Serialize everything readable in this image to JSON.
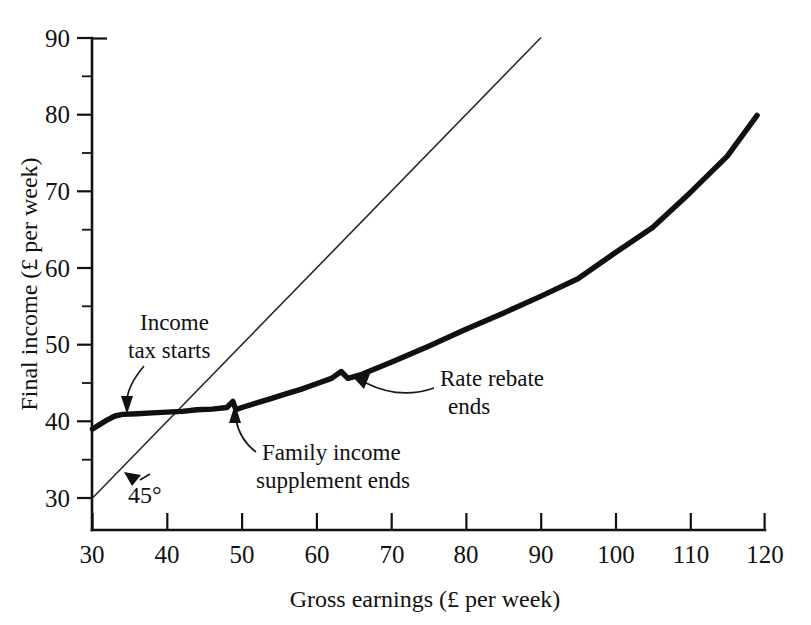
{
  "chart_data": {
    "type": "line",
    "title": "",
    "xlabel": "Gross earnings (£ per week)",
    "ylabel": "Final income (£ per week)",
    "xlim": [
      30,
      120
    ],
    "ylim": [
      30,
      90
    ],
    "xticks": [
      30,
      40,
      50,
      60,
      70,
      80,
      90,
      100,
      110,
      120
    ],
    "yticks": [
      30,
      40,
      50,
      60,
      70,
      80,
      90
    ],
    "xtick_labels": [
      "30",
      "40",
      "50",
      "60",
      "70",
      "80",
      "90",
      "100",
      "110",
      "120"
    ],
    "ytick_labels": [
      "30",
      "40",
      "50",
      "60",
      "70",
      "80",
      "90"
    ],
    "x_minor_step": 5,
    "y_minor_step": 5,
    "grid": false,
    "legend": "none",
    "series": [
      {
        "name": "Final income after taxes and benefits",
        "style": "thick-solid",
        "points": [
          [
            30.0,
            39.0
          ],
          [
            31.0,
            39.6
          ],
          [
            32.0,
            40.2
          ],
          [
            33.0,
            40.7
          ],
          [
            34.0,
            40.9
          ],
          [
            36.0,
            41.0
          ],
          [
            38.0,
            41.1
          ],
          [
            40.0,
            41.2
          ],
          [
            42.0,
            41.3
          ],
          [
            44.0,
            41.5
          ],
          [
            46.0,
            41.6
          ],
          [
            48.0,
            41.8
          ],
          [
            48.8,
            42.6
          ],
          [
            49.2,
            41.5
          ],
          [
            50.0,
            41.8
          ],
          [
            52.0,
            42.4
          ],
          [
            54.0,
            43.0
          ],
          [
            56.0,
            43.6
          ],
          [
            58.0,
            44.2
          ],
          [
            60.0,
            44.9
          ],
          [
            62.0,
            45.6
          ],
          [
            63.3,
            46.5
          ],
          [
            64.2,
            45.6
          ],
          [
            66.0,
            46.1
          ],
          [
            70.0,
            47.7
          ],
          [
            75.0,
            49.8
          ],
          [
            80.0,
            52.0
          ],
          [
            85.0,
            54.1
          ],
          [
            90.0,
            56.3
          ],
          [
            95.0,
            58.6
          ],
          [
            100.0,
            62.0
          ],
          [
            105.0,
            65.3
          ],
          [
            110.0,
            69.8
          ],
          [
            115.0,
            74.6
          ],
          [
            119.0,
            79.9
          ]
        ]
      },
      {
        "name": "45 degree line",
        "style": "thin-solid",
        "points": [
          [
            30.0,
            30.0
          ],
          [
            90.0,
            90.0
          ]
        ]
      }
    ],
    "annotations": [
      {
        "id": "income-tax-starts",
        "text_lines": [
          "Income",
          "tax starts"
        ],
        "target_x": 33.5,
        "target_y": 40.8
      },
      {
        "id": "family-income-supplement-ends",
        "text_lines": [
          "Family income",
          "supplement ends"
        ],
        "target_x": 49.0,
        "target_y": 41.6
      },
      {
        "id": "rate-rebate-ends",
        "text_lines": [
          "Rate rebate",
          "ends"
        ],
        "target_x": 64.2,
        "target_y": 45.8
      },
      {
        "id": "forty-five-degrees",
        "text_lines": [
          "45°"
        ],
        "target_x": 35.5,
        "target_y": 35.5
      }
    ]
  },
  "labels": {
    "income_tax_line1": "Income",
    "income_tax_line2": "tax starts",
    "fis_line1": "Family income",
    "fis_line2": "supplement ends",
    "rate_rebate_line1": "Rate rebate",
    "rate_rebate_line2": "ends",
    "degree_label": "45°",
    "x_axis_title": "Gross earnings (£ per week)",
    "y_axis_title": "Final income (£ per week)"
  },
  "ytick_text": {
    "t90": "90",
    "t80": "80",
    "t70": "70",
    "t60": "60",
    "t50": "50",
    "t40": "40",
    "t30": "30"
  },
  "xtick_text": {
    "t30": "30",
    "t40": "40",
    "t50": "50",
    "t60": "60",
    "t70": "70",
    "t80": "80",
    "t90": "90",
    "t100": "100",
    "t110": "110",
    "t120": "120"
  },
  "colors": {
    "ink": "#111111",
    "background": "#ffffff",
    "curve": "#101010",
    "reference_line": "#2a2a2a"
  }
}
